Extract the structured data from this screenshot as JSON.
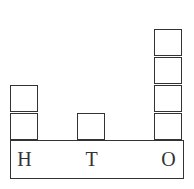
{
  "diagram": {
    "columns": [
      {
        "label": "H",
        "count": 2
      },
      {
        "label": "T",
        "count": 1
      },
      {
        "label": "O",
        "count": 4
      }
    ]
  }
}
